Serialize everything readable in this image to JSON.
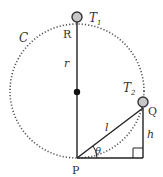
{
  "diagram": {
    "circle_label": "C",
    "top_point": "R",
    "bottom_point": "P",
    "right_point": "Q",
    "radius_label": "r",
    "chord_label": "l",
    "height_label": "h",
    "angle_label": "θ",
    "ball1_label": "T",
    "ball1_sub": "1",
    "ball2_label": "T",
    "ball2_sub": "2",
    "colors": {
      "line": "#222222",
      "ball_fill": "#c8c8c8",
      "dots": "#555555"
    }
  }
}
